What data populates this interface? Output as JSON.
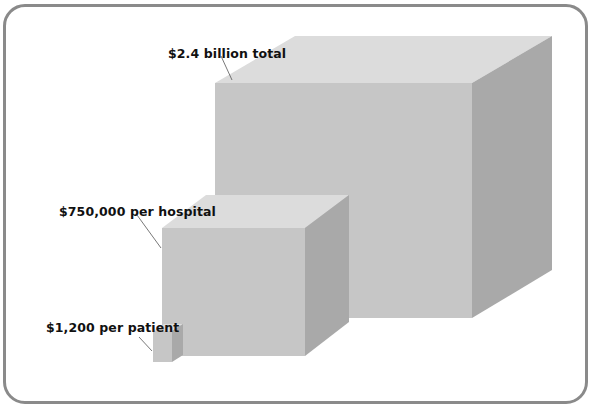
{
  "diagram": {
    "type": "cube-size-comparison",
    "colors": {
      "top_face": "#dcdcdc",
      "front_face": "#c6c6c6",
      "side_face": "#a9a9a9",
      "frame": "#8a8a8a",
      "leader_line": "#555555",
      "text": "#111111"
    },
    "cubes": [
      {
        "id": "total",
        "label": "$2.4 billion total"
      },
      {
        "id": "hospital",
        "label": "$750,000 per hospital"
      },
      {
        "id": "patient",
        "label": "$1,200 per patient"
      }
    ]
  }
}
